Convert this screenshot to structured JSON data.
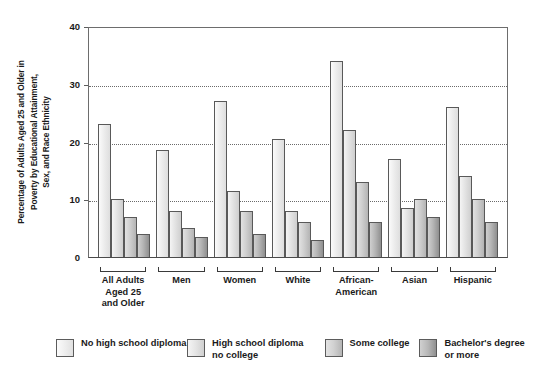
{
  "chart_data": {
    "type": "bar",
    "title": "",
    "xlabel": "",
    "ylabel": "Percentage of Adults Aged 25 and Older in Poverty by Educational Attainment, Sex, and Race Ethnicity",
    "ylim": [
      0,
      40
    ],
    "yticks": [
      0,
      10,
      20,
      30,
      40
    ],
    "ytick_labels": [
      "0",
      "10",
      "20",
      "30",
      "40"
    ],
    "grid": "horizontal-dotted",
    "legend_position": "bottom",
    "categories": [
      "All Adults\nAged 25\nand Older",
      "Men",
      "Women",
      "White",
      "African-\nAmerican",
      "Asian",
      "Hispanic"
    ],
    "category_lines": [
      [
        "All Adults",
        "Aged 25",
        "and Older"
      ],
      [
        "Men"
      ],
      [
        "Women"
      ],
      [
        "White"
      ],
      [
        "African-",
        "American"
      ],
      [
        "Asian"
      ],
      [
        "Hispanic"
      ]
    ],
    "series": [
      {
        "name": "No high school diploma",
        "legend_lines": [
          "No high school diploma"
        ],
        "values": [
          23,
          18.5,
          27,
          20.5,
          34,
          17,
          26
        ]
      },
      {
        "name": "High school diploma no college",
        "legend_lines": [
          "High school diploma",
          "no college"
        ],
        "values": [
          10,
          8,
          11.5,
          8,
          22,
          8.5,
          14
        ]
      },
      {
        "name": "Some college",
        "legend_lines": [
          "Some college"
        ],
        "values": [
          7,
          5,
          8,
          6,
          13,
          10,
          10
        ]
      },
      {
        "name": "Bachelor's degree or more",
        "legend_lines": [
          "Bachelor's degree",
          "or more"
        ],
        "values": [
          4,
          3.5,
          4,
          3,
          6,
          7,
          6
        ]
      }
    ]
  }
}
